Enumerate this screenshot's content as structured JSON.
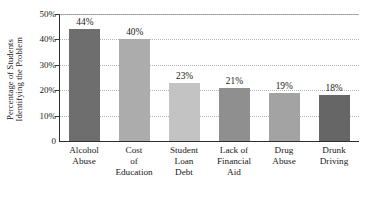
{
  "chart_data": {
    "type": "bar",
    "title": "",
    "xlabel": "",
    "ylabel": "Percentage of Students Identifying the Problem",
    "ylabel_lines": [
      "Percentage of Students",
      "Identifying the Problem"
    ],
    "categories": [
      "Alcohol Abuse",
      "Cost of Education",
      "Student Loan Debt",
      "Lack of Financial Aid",
      "Drug Abuse",
      "Drunk Driving"
    ],
    "category_lines": [
      [
        "Alcohol",
        "Abuse"
      ],
      [
        "Cost",
        "of",
        "Education"
      ],
      [
        "Student",
        "Loan",
        "Debt"
      ],
      [
        "Lack of",
        "Financial",
        "Aid"
      ],
      [
        "Drug",
        "Abuse"
      ],
      [
        "Drunk",
        "Driving"
      ]
    ],
    "values": [
      44,
      40,
      23,
      21,
      19,
      18
    ],
    "value_labels": [
      "44%",
      "40%",
      "23%",
      "21%",
      "19%",
      "18%"
    ],
    "bar_colors": [
      "#6e6e6e",
      "#acacac",
      "#c3c3c3",
      "#8f8f8f",
      "#a3a3a3",
      "#666666"
    ],
    "ylim": [
      0,
      50
    ],
    "y_ticks": [
      0,
      10,
      20,
      30,
      40,
      50
    ],
    "y_tick_labels": [
      "0",
      "10%",
      "20%",
      "30%",
      "40%",
      "50%"
    ],
    "grid": true,
    "grid_axis": "y",
    "legend": "none",
    "axis_color": "#2e2e2e",
    "grid_color": "#b6b6b6",
    "background": "#ffffff"
  }
}
